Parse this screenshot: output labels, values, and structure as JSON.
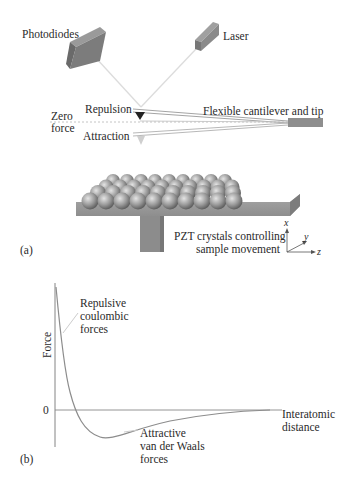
{
  "panel_a": {
    "label": "(a)",
    "photodiodes": "Photodiodes",
    "laser": "Laser",
    "repulsion": "Repulsion",
    "zero_force_line1": "Zero",
    "zero_force_line2": "force",
    "attraction": "Attraction",
    "cantilever": "Flexible cantilever and tip",
    "pzt_line1": "PZT crystals controlling",
    "pzt_line2": "sample movement",
    "axes": {
      "x": "x",
      "y": "y",
      "z": "z"
    }
  },
  "panel_b": {
    "label": "(b)",
    "ylabel": "Force",
    "zero_tick": "0",
    "xlabel_line1": "Interatomic",
    "xlabel_line2": "distance",
    "repulsive_line1": "Repulsive",
    "repulsive_line2": "coulombic",
    "repulsive_line3": "forces",
    "attractive_line1": "Attractive",
    "attractive_line2": "van der Waals",
    "attractive_line3": "forces"
  },
  "colors": {
    "block_gray": "#8a8a8a",
    "block_dark": "#6e6e6e",
    "beam": "#d8d8d8",
    "curve": "#8c8c8c",
    "axis": "#777777",
    "text": "#2a2a2a"
  }
}
